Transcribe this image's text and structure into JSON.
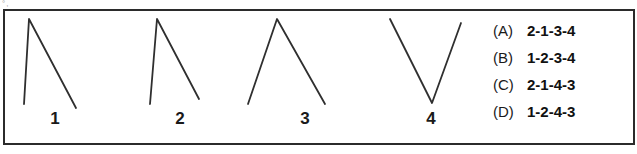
{
  "artifact": {
    "mark": "°,"
  },
  "figures": {
    "stroke_color": "#2f2f2f",
    "labels": [
      {
        "id": "figure-1",
        "text": "1"
      },
      {
        "id": "figure-2",
        "text": "2"
      },
      {
        "id": "figure-3",
        "text": "3"
      },
      {
        "id": "figure-4",
        "text": "4"
      }
    ],
    "shapes": [
      {
        "name": "figure-1-polyline",
        "description": "steep near-vertical left leg rising to a peak, then a long shallow diagonal falling to the right"
      },
      {
        "name": "figure-2-polyline",
        "description": "steep near-vertical left leg rising to a peak, then a shorter diagonal falling to the right"
      },
      {
        "name": "figure-3-polyline",
        "description": "symmetric inverted-V peak with two equally sloped legs"
      },
      {
        "name": "figure-4-polyline",
        "description": "V shaped valley with two equally sloped legs meeting at the bottom"
      }
    ]
  },
  "options": {
    "panel_border_color": "#2b2b2b",
    "items": [
      {
        "key": "(A)",
        "value": "2-1-3-4"
      },
      {
        "key": "(B)",
        "value": "1-2-3-4"
      },
      {
        "key": "(C)",
        "value": "2-1-4-3"
      },
      {
        "key": "(D)",
        "value": "1-2-4-3"
      }
    ]
  }
}
